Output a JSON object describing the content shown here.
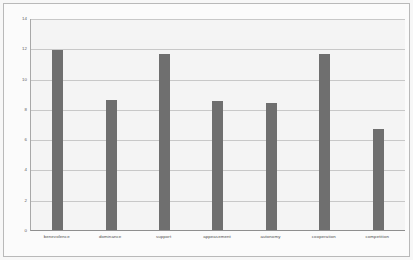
{
  "chart_data": {
    "type": "bar",
    "title": "",
    "subtitle": "",
    "xlabel": "",
    "ylabel": "",
    "categories": [
      "benevolence",
      "dominance",
      "support",
      "appeasement",
      "autonomy",
      "cooperation",
      "competition"
    ],
    "values": [
      11.9,
      8.6,
      11.6,
      8.5,
      8.4,
      11.6,
      6.7
    ],
    "series": [
      {
        "name": "",
        "values": [
          11.9,
          8.6,
          11.6,
          8.5,
          8.4,
          11.6,
          6.7
        ]
      }
    ],
    "ylim": [
      0,
      14
    ],
    "ytick_labels": [
      "14",
      "12",
      "10",
      "8",
      "6",
      "4",
      "2",
      "0"
    ],
    "ytick_values": [
      14,
      12,
      10,
      8,
      6,
      4,
      2,
      0
    ],
    "grid": true,
    "grid_orientation": "horizontal",
    "legend": false,
    "legend_position": "none",
    "bar_color": "#6f6f6f",
    "plot_background": "#f4f4f4",
    "gridline_color": "#c8c8c8",
    "axis_color": "#8f8f8f",
    "frame_color": "#b9b9b9"
  }
}
